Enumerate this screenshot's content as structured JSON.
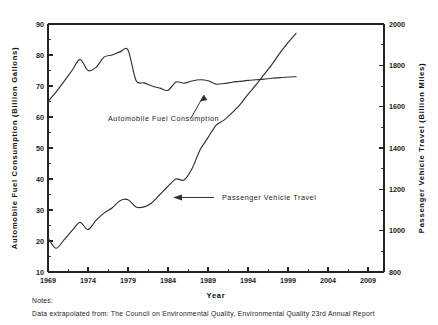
{
  "chart_data": {
    "type": "line",
    "title": "",
    "xlabel": "Year",
    "ylabel": "Automobile Fuel Consumption (Billion Gallons)",
    "y2label": "Passenger Vehicle Travel (Billion Miles)",
    "grid": false,
    "legend_position": "inline-annotations",
    "xlim": [
      1969,
      2011
    ],
    "xticks": [
      "1969",
      "1974",
      "1979",
      "1984",
      "1989",
      "1994",
      "1999",
      "2004",
      "2009"
    ],
    "xtick_values": [
      1969,
      1974,
      1979,
      1984,
      1989,
      1994,
      1999,
      2004,
      2009
    ],
    "ylim": [
      10,
      90
    ],
    "yticks": [
      "10",
      "20",
      "30",
      "40",
      "50",
      "60",
      "70",
      "80",
      "90"
    ],
    "ytick_values": [
      10,
      20,
      30,
      40,
      50,
      60,
      70,
      80,
      90
    ],
    "y2lim": [
      800,
      2000
    ],
    "y2ticks": [
      "800",
      "1000",
      "1200",
      "1400",
      "1600",
      "1800",
      "2000"
    ],
    "y2tick_values": [
      800,
      1000,
      1200,
      1400,
      1600,
      1800,
      2000
    ],
    "series": [
      {
        "name": "Automobile Fuel Consumption",
        "axis": "left",
        "units": "Billion Gallons",
        "x": [
          1969,
          1970,
          1971,
          1972,
          1973,
          1974,
          1975,
          1976,
          1977,
          1978,
          1979,
          1980,
          1981,
          1982,
          1983,
          1984,
          1985,
          1986,
          1987,
          1988,
          1989,
          1990,
          1991,
          1992,
          1993,
          1994,
          1995,
          1996,
          1997,
          1998,
          1999,
          2000
        ],
        "values": [
          65.0,
          68.0,
          71.5,
          75.0,
          78.6,
          75.0,
          76.0,
          79.3,
          80.0,
          81.0,
          81.6,
          71.8,
          71.0,
          70.0,
          69.3,
          68.6,
          71.3,
          70.9,
          71.6,
          72.0,
          71.7,
          70.6,
          70.8,
          71.2,
          71.5,
          71.8,
          72.0,
          72.2,
          72.5,
          72.7,
          72.9,
          73.0
        ]
      },
      {
        "name": "Passenger Vehicle Travel",
        "axis": "right",
        "units": "Billion Miles",
        "x": [
          1969,
          1970,
          1971,
          1972,
          1973,
          1974,
          1975,
          1976,
          1977,
          1978,
          1979,
          1980,
          1981,
          1982,
          1983,
          1984,
          1985,
          1986,
          1987,
          1988,
          1989,
          1990,
          1991,
          1992,
          1993,
          1994,
          1995,
          1996,
          1997,
          1998,
          1999,
          2000
        ],
        "values": [
          965,
          915,
          955,
          1000,
          1040,
          1005,
          1050,
          1085,
          1110,
          1145,
          1150,
          1115,
          1115,
          1135,
          1175,
          1215,
          1250,
          1245,
          1300,
          1390,
          1450,
          1510,
          1535,
          1570,
          1610,
          1660,
          1705,
          1755,
          1805,
          1860,
          1910,
          1955
        ]
      }
    ],
    "annotations": [
      {
        "label": "Automobile Fuel Consumption",
        "arrow_direction": "up-right",
        "target_series": "Automobile Fuel Consumption"
      },
      {
        "label": "Passenger Vehicle Travel",
        "arrow_direction": "left",
        "target_series": "Passenger Vehicle Travel"
      }
    ]
  },
  "notes": {
    "heading": "Notes:",
    "line1": "Data extrapolated from:  The Council on Environmental Quality, Environmental Quality 23rd Annual Report"
  }
}
